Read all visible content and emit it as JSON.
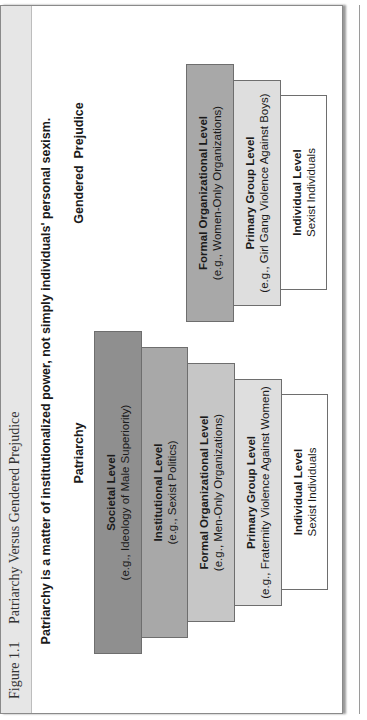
{
  "figure": {
    "number": "Figure 1.1",
    "title": "Patriarchy Versus Gendered Prejudice",
    "headline": "Patriarchy is a matter of institutionalized power, not simply individuals' personal sexism."
  },
  "patriarchy": {
    "title": "Patriarchy",
    "levels": [
      {
        "level": "Societal Level",
        "example": "(e.g., Ideology of Male Superiority)",
        "color": "#8f8f8f"
      },
      {
        "level": "Institutional Level",
        "example": "(e.g., Sexist Politics)",
        "color": "#a8a8a8"
      },
      {
        "level": "Formal Organizational Level",
        "example": "(e.g., Men-Only Organizations)",
        "color": "#c6c6c6"
      },
      {
        "level": "Primary Group Level",
        "example": "(e.g., Fraternity Violence Against Women)",
        "color": "#dedede"
      },
      {
        "level": "Individual Level",
        "example": "Sexist Individuals",
        "color": "#ffffff"
      }
    ]
  },
  "gendered_prejudice": {
    "title": "Gendered  Prejudice",
    "levels": [
      {
        "level": "Formal Organizational Level",
        "example": "(e.g., Women-Only Organizations)",
        "color": "#a8a8a8"
      },
      {
        "level": "Primary Group Level",
        "example": "(e.g., Girl Gang Violence Against Boys)",
        "color": "#dedede"
      },
      {
        "level": "Individual Level",
        "example": "Sexist Individuals",
        "color": "#ffffff"
      }
    ]
  }
}
